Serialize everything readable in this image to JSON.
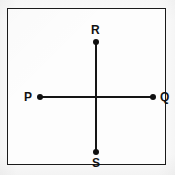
{
  "figure": {
    "title": "",
    "frame": {
      "shape": "square-border"
    },
    "points": [
      {
        "id": "P",
        "label": "P",
        "position": "left"
      },
      {
        "id": "Q",
        "label": "Q",
        "position": "right"
      },
      {
        "id": "R",
        "label": "R",
        "position": "top"
      },
      {
        "id": "S",
        "label": "S",
        "position": "bottom"
      }
    ],
    "segments": [
      {
        "id": "PQ",
        "from": "P",
        "to": "Q",
        "orientation": "horizontal"
      },
      {
        "id": "RS",
        "from": "R",
        "to": "S",
        "orientation": "vertical"
      }
    ],
    "caption_partial": "",
    "colors": {
      "ink": "#151515",
      "paper": "#fbfbfb",
      "frame": "#1a1a1a"
    }
  }
}
